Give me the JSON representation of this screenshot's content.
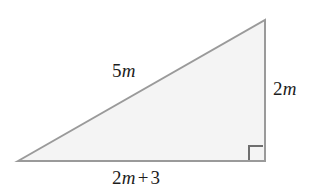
{
  "figure": {
    "type": "right-triangle",
    "background_color": "#ffffff",
    "fill_color": "#f4f4f4",
    "stroke_color": "#9a9a9a",
    "label_color": "#1d1d1d",
    "vertices": {
      "left": [
        18,
        161
      ],
      "top_right": [
        265,
        20
      ],
      "bottom_right": [
        265,
        161
      ]
    },
    "right_angle": {
      "at_vertex": "bottom_right",
      "marker_size": 14
    },
    "labels": {
      "hypotenuse": {
        "coefficient": "5",
        "variable": "m",
        "full_text": "5m"
      },
      "vertical_leg": {
        "coefficient": "2",
        "variable": "m",
        "full_text": "2m"
      },
      "base_leg": {
        "coefficient": "2",
        "variable": "m",
        "operator": "+",
        "constant": "3",
        "full_text": "2m + 3"
      }
    }
  }
}
